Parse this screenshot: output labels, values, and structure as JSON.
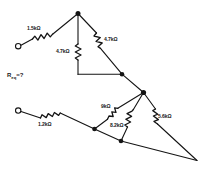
{
  "diagram": {
    "unknown_label": "R",
    "unknown_sub": "eq",
    "unknown_eq": "=?",
    "components": [
      {
        "id": "r1",
        "name": "resistor-1-5k",
        "label": "1.5kΩ"
      },
      {
        "id": "r2",
        "name": "resistor-4-7k-vertical",
        "label": "4.7kΩ"
      },
      {
        "id": "r3",
        "name": "resistor-4-7k-diagonal",
        "label": "4.7kΩ"
      },
      {
        "id": "r4",
        "name": "resistor-1-2k",
        "label": "1.2kΩ"
      },
      {
        "id": "r5",
        "name": "resistor-9k",
        "label": "9kΩ"
      },
      {
        "id": "r6",
        "name": "resistor-8-2k",
        "label": "8.2kΩ"
      },
      {
        "id": "r7",
        "name": "resistor-5-6k",
        "label": "5.6kΩ"
      }
    ],
    "terminals": [
      {
        "id": "t1",
        "name": "terminal-top-left"
      },
      {
        "id": "t2",
        "name": "terminal-bottom-left"
      }
    ],
    "colors": {
      "ink": "#141414",
      "background": "#ffffff"
    }
  }
}
